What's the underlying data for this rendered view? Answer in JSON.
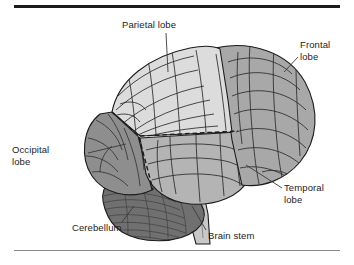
{
  "figure": {
    "background_color": "#ffffff",
    "rules": {
      "top_rule_color": "#1b1b1b",
      "bottom_rule_color": "#8a8a8a"
    },
    "palette": {
      "parietal_lobe_fill": "#dcdcdc",
      "frontal_lobe_fill": "#a8a8a8",
      "temporal_lobe_fill": "#b4b4b4",
      "occipital_lobe_fill": "#8e8e8e",
      "cerebellum_fill": "#707070",
      "brain_stem_fill": "#c8c8c8",
      "outline_color": "#1c1c1c",
      "gyri_line_color": "#2b2b2b",
      "leader_line_color": "#3a3a3a"
    },
    "labels": [
      {
        "id": "parietal",
        "text": "Parietal lobe",
        "region": "parietal-lobe"
      },
      {
        "id": "frontal",
        "text": "Frontal\nlobe",
        "region": "frontal-lobe"
      },
      {
        "id": "occipital",
        "text": "Occipital\nlobe",
        "region": "occipital-lobe"
      },
      {
        "id": "temporal",
        "text": "Temporal\nlobe",
        "region": "temporal-lobe"
      },
      {
        "id": "cerebellum",
        "text": "Cerebellum",
        "region": "cerebellum"
      },
      {
        "id": "brainstem",
        "text": "Brain stem",
        "region": "brain-stem"
      }
    ]
  }
}
